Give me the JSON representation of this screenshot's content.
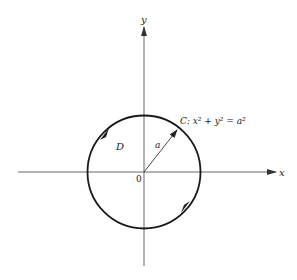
{
  "diagram": {
    "type": "circle-region-green-theorem",
    "colors": {
      "stroke": "#1a1a1a",
      "axis": "#444444",
      "text": "#222222"
    },
    "axes": {
      "x_label": "x",
      "y_label": "y",
      "origin_label": "0"
    },
    "region_label": "D",
    "radius_label": "a",
    "curve_label": {
      "prefix": "C: ",
      "equation": "x² + y² = a²"
    },
    "orientation": "counterclockwise"
  }
}
